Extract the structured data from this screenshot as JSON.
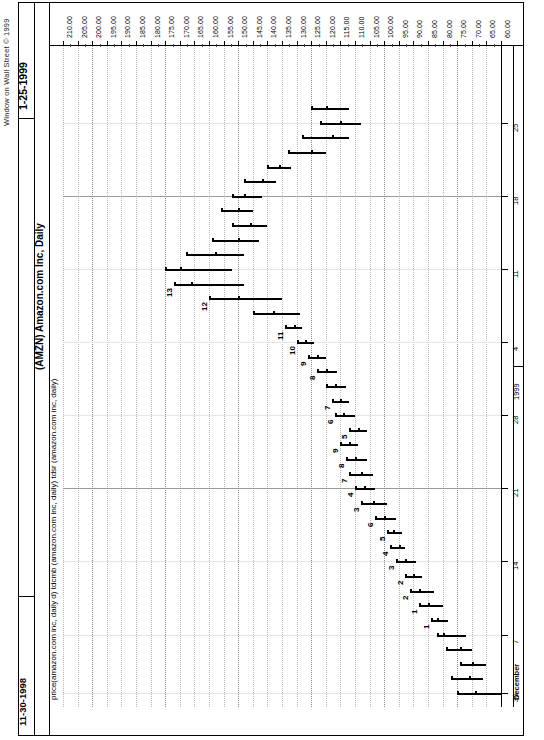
{
  "app": {
    "vendor_copyright": "Window on Wall Street © 1999",
    "chart_title": "(AMZN)  Amazon.com Inc, Daily",
    "study_line": "price(amazon.com inc, daily d)  tdcmb (amazon.com inc, daily)  tdsr (amazon.com inc, daily)",
    "date_start": "11-30-1998",
    "date_end": "1-25-1999"
  },
  "chart_data": {
    "type": "bar",
    "orientation": "rotated-90",
    "title": "(AMZN)  Amazon.com Inc, Daily",
    "xlabel": "Date",
    "ylabel": "Price",
    "grid": true,
    "legend": "none",
    "price_axis": {
      "ticks": [
        "210.00",
        "205.00",
        "200.00",
        "195.00",
        "190.00",
        "185.00",
        "180.00",
        "175.00",
        "170.00",
        "165.00",
        "160.00",
        "155.00",
        "150.00",
        "145.00",
        "140.00",
        "135.00",
        "130.00",
        "125.00",
        "120.00",
        "115.00",
        "110.00",
        "105.00",
        "100.00",
        "95.00",
        "90.00",
        "85.00",
        "80.00",
        "75.00",
        "70.00",
        "65.00",
        "60.00"
      ],
      "min": 60,
      "max": 210,
      "step": 5
    },
    "date_axis": {
      "ticks": [
        "30",
        "7",
        "14",
        "21",
        "28",
        "4",
        "11",
        "18",
        "25"
      ],
      "month_label": "December",
      "year_label": "1999"
    },
    "annotations": [
      "1",
      "2",
      "3",
      "4",
      "5",
      "6",
      "7",
      "8",
      "9",
      "10",
      "11",
      "12",
      "13",
      "1",
      "2",
      "3",
      "4",
      "5",
      "6",
      "7",
      "8",
      "9"
    ],
    "series_name": "AMZN daily high-low-close bars",
    "bars": [
      {
        "i": 0,
        "high": 75,
        "low": 60,
        "close": 69,
        "label": ""
      },
      {
        "i": 1,
        "high": 77,
        "low": 66,
        "close": 71,
        "label": ""
      },
      {
        "i": 2,
        "high": 74,
        "low": 65,
        "close": 70,
        "label": ""
      },
      {
        "i": 3,
        "high": 79,
        "low": 70,
        "close": 74,
        "label": ""
      },
      {
        "i": 4,
        "high": 82,
        "low": 72,
        "close": 80,
        "label": ""
      },
      {
        "i": 5,
        "high": 84,
        "low": 78,
        "close": 82,
        "label": "1"
      },
      {
        "i": 6,
        "high": 88,
        "low": 80,
        "close": 85,
        "label": "1"
      },
      {
        "i": 7,
        "high": 91,
        "low": 83,
        "close": 88,
        "label": "2"
      },
      {
        "i": 8,
        "high": 93,
        "low": 87,
        "close": 90,
        "label": "2"
      },
      {
        "i": 9,
        "high": 96,
        "low": 89,
        "close": 93,
        "label": "3"
      },
      {
        "i": 10,
        "high": 98,
        "low": 93,
        "close": 95,
        "label": "4"
      },
      {
        "i": 11,
        "high": 99,
        "low": 94,
        "close": 97,
        "label": "5"
      },
      {
        "i": 12,
        "high": 103,
        "low": 96,
        "close": 100,
        "label": "6"
      },
      {
        "i": 13,
        "high": 108,
        "low": 99,
        "close": 104,
        "label": "3"
      },
      {
        "i": 14,
        "high": 110,
        "low": 103,
        "close": 107,
        "label": "4"
      },
      {
        "i": 15,
        "high": 112,
        "low": 104,
        "close": 108,
        "label": "7"
      },
      {
        "i": 16,
        "high": 113,
        "low": 106,
        "close": 110,
        "label": "8"
      },
      {
        "i": 17,
        "high": 115,
        "low": 109,
        "close": 112,
        "label": "9"
      },
      {
        "i": 18,
        "high": 112,
        "low": 106,
        "close": 109,
        "label": "5"
      },
      {
        "i": 19,
        "high": 117,
        "low": 110,
        "close": 114,
        "label": "6"
      },
      {
        "i": 20,
        "high": 118,
        "low": 112,
        "close": 115,
        "label": "7"
      },
      {
        "i": 21,
        "high": 120,
        "low": 113,
        "close": 117,
        "label": ""
      },
      {
        "i": 22,
        "high": 123,
        "low": 116,
        "close": 120,
        "label": "8"
      },
      {
        "i": 23,
        "high": 126,
        "low": 120,
        "close": 123,
        "label": "9"
      },
      {
        "i": 24,
        "high": 130,
        "low": 124,
        "close": 127,
        "label": "10"
      },
      {
        "i": 25,
        "high": 134,
        "low": 128,
        "close": 131,
        "label": "11"
      },
      {
        "i": 26,
        "high": 145,
        "low": 129,
        "close": 138,
        "label": ""
      },
      {
        "i": 27,
        "high": 160,
        "low": 135,
        "close": 150,
        "label": "12"
      },
      {
        "i": 28,
        "high": 172,
        "low": 148,
        "close": 166,
        "label": "13"
      },
      {
        "i": 29,
        "high": 175,
        "low": 152,
        "close": 170,
        "label": ""
      },
      {
        "i": 30,
        "high": 168,
        "low": 148,
        "close": 158,
        "label": ""
      },
      {
        "i": 31,
        "high": 159,
        "low": 143,
        "close": 150,
        "label": ""
      },
      {
        "i": 32,
        "high": 152,
        "low": 140,
        "close": 146,
        "label": ""
      },
      {
        "i": 33,
        "high": 156,
        "low": 145,
        "close": 150,
        "label": ""
      },
      {
        "i": 34,
        "high": 152,
        "low": 142,
        "close": 148,
        "label": ""
      },
      {
        "i": 35,
        "high": 148,
        "low": 137,
        "close": 142,
        "label": ""
      },
      {
        "i": 36,
        "high": 140,
        "low": 132,
        "close": 136,
        "label": ""
      },
      {
        "i": 37,
        "high": 133,
        "low": 120,
        "close": 125,
        "label": ""
      },
      {
        "i": 38,
        "high": 128,
        "low": 112,
        "close": 118,
        "label": ""
      },
      {
        "i": 39,
        "high": 122,
        "low": 108,
        "close": 115,
        "label": ""
      },
      {
        "i": 40,
        "high": 125,
        "low": 112,
        "close": 120,
        "label": ""
      }
    ]
  }
}
